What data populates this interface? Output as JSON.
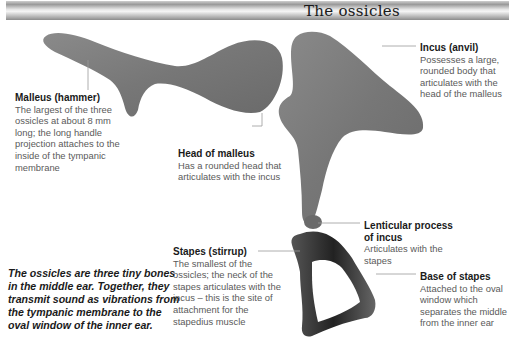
{
  "header": {
    "title": "The ossicles"
  },
  "labels": {
    "malleus": {
      "title": "Malleus (hammer)",
      "text": "The largest of the three ossicles at about 8 mm long; the long handle projection attaches to the inside of the tympanic membrane"
    },
    "incus": {
      "title": "Incus (anvil)",
      "text": "Possesses a large, rounded body that articulates with the head of the malleus"
    },
    "head_of_malleus": {
      "title": "Head of malleus",
      "text": "Has a rounded head that articulates with the incus"
    },
    "lenticular_process": {
      "title": "Lenticular process of incus",
      "text": "Articulates with the stapes"
    },
    "stapes": {
      "title": "Stapes (stirrup)",
      "text": "The smallest of the ossicles; the neck of the stapes articulates with the incus – this is the site of attachment for the stapedius muscle"
    },
    "base_of_stapes": {
      "title": "Base of stapes",
      "text": "Attached to the oval window which separates the middle from the inner ear"
    }
  },
  "summary": {
    "text": "The ossicles are three tiny bones in the middle ear. Together, they transmit sound as vibrations from the tympanic membrane to the oval window of the inner ear."
  },
  "colors": {
    "bone": "#7a7a7a",
    "bone_dark": "#3a3a3a",
    "leader_line": "#999999",
    "label_title": "#1a1a1a",
    "label_text": "#5a5a5a"
  }
}
